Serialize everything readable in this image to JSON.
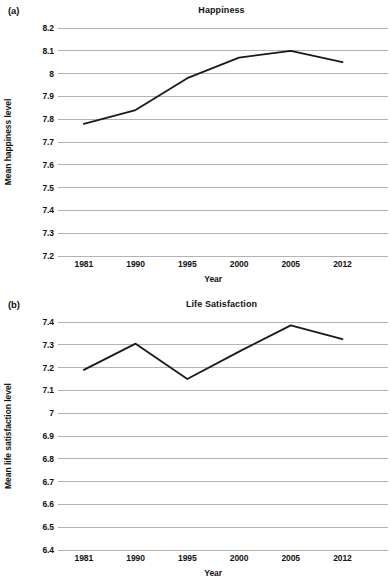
{
  "figure": {
    "xlabel": "Year"
  },
  "panels": [
    {
      "label": "(a)",
      "title": "Happiness",
      "ylabel": "Mean happiness level"
    },
    {
      "label": "(b)",
      "title": "Life Satisfaction",
      "ylabel": "Mean life satisfaction level"
    }
  ],
  "chart_data": [
    {
      "type": "line",
      "title": "Happiness",
      "panel_label": "(a)",
      "xlabel": "Year",
      "ylabel": "Mean happiness level",
      "categories": [
        "1981",
        "1990",
        "1995",
        "2000",
        "2005",
        "2012"
      ],
      "values": [
        7.78,
        7.84,
        7.98,
        8.07,
        8.1,
        8.05
      ],
      "ylim": [
        7.2,
        8.2
      ],
      "yticks": [
        "8.2",
        "8.1",
        "8",
        "7.9",
        "7.8",
        "7.7",
        "7.6",
        "7.5",
        "7.4",
        "7.3",
        "7.2"
      ],
      "ytick_values": [
        8.2,
        8.1,
        8.0,
        7.9,
        7.8,
        7.7,
        7.6,
        7.5,
        7.4,
        7.3,
        7.2
      ],
      "grid": true,
      "legend": "none",
      "line_color": "#1a1a1a",
      "grid_color": "#b3b3b3"
    },
    {
      "type": "line",
      "title": "Life Satisfaction",
      "panel_label": "(b)",
      "xlabel": "Year",
      "ylabel": "Mean life satisfaction level",
      "categories": [
        "1981",
        "1990",
        "1995",
        "2000",
        "2005",
        "2012"
      ],
      "values": [
        7.19,
        7.305,
        7.15,
        7.27,
        7.385,
        7.325
      ],
      "ylim": [
        6.4,
        7.4
      ],
      "yticks": [
        "7.4",
        "7.3",
        "7.2",
        "7.1",
        "7",
        "6.9",
        "6.8",
        "6.7",
        "6.6",
        "6.5",
        "6.4"
      ],
      "ytick_values": [
        7.4,
        7.3,
        7.2,
        7.1,
        7.0,
        6.9,
        6.8,
        6.7,
        6.6,
        6.5,
        6.4
      ],
      "grid": true,
      "legend": "none",
      "line_color": "#1a1a1a",
      "grid_color": "#b3b3b3"
    }
  ]
}
